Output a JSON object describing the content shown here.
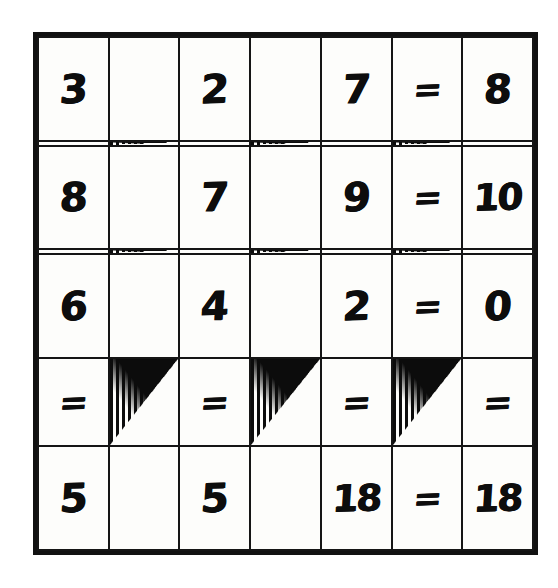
{
  "page": {
    "background_color": "#ffffff",
    "ink_color": "#0d0d0d"
  },
  "grid": {
    "rows": 7,
    "columns": 7,
    "border_color": "#111111",
    "cell_background": "#fdfdfb",
    "hatch_color": "#0c0c0c"
  },
  "cells": {
    "r1c1": "3",
    "r1c2": "",
    "r1c3": "2",
    "r1c4": "",
    "r1c5": "7",
    "r1c6": "=",
    "r1c7": "8",
    "r2c1": "",
    "r2c2": "",
    "r2c3": "",
    "r2c4": "",
    "r2c5": "",
    "r2c6": "",
    "r2c7": "",
    "r3c1": "8",
    "r3c2": "",
    "r3c3": "7",
    "r3c4": "",
    "r3c5": "9",
    "r3c6": "=",
    "r3c7": "10",
    "r4c1": "",
    "r4c2": "",
    "r4c3": "",
    "r4c4": "",
    "r4c5": "",
    "r4c6": "",
    "r4c7": "",
    "r5c1": "6",
    "r5c2": "",
    "r5c3": "4",
    "r5c4": "",
    "r5c5": "2",
    "r5c6": "=",
    "r5c7": "0",
    "r6c1": "=",
    "r6c2": "",
    "r6c3": "=",
    "r6c4": "",
    "r6c5": "=",
    "r6c6": "",
    "r6c7": "=",
    "r7c1": "5",
    "r7c2": "",
    "r7c3": "5",
    "r7c4": "",
    "r7c5": "18",
    "r7c6": "=",
    "r7c7": "18"
  },
  "chart_data": {
    "type": "table",
    "rows": 7,
    "columns": 7,
    "grid": [
      [
        "3",
        "",
        "2",
        "",
        "7",
        "=",
        "8"
      ],
      [
        "",
        "hatched-triangle",
        "",
        "hatched-triangle",
        "",
        "hatched-triangle",
        ""
      ],
      [
        "8",
        "",
        "7",
        "",
        "9",
        "=",
        "10"
      ],
      [
        "",
        "hatched-triangle",
        "",
        "hatched-triangle",
        "",
        "hatched-triangle",
        ""
      ],
      [
        "6",
        "",
        "4",
        "",
        "2",
        "=",
        "0"
      ],
      [
        "=",
        "hatched-triangle",
        "=",
        "hatched-triangle",
        "=",
        "hatched-triangle",
        "="
      ],
      [
        "5",
        "",
        "5",
        "",
        "18",
        "=",
        "18"
      ]
    ],
    "triangle_cells": [
      "r2c2",
      "r2c4",
      "r2c6",
      "r4c2",
      "r4c4",
      "r4c6",
      "r6c2",
      "r6c4",
      "r6c6"
    ]
  }
}
